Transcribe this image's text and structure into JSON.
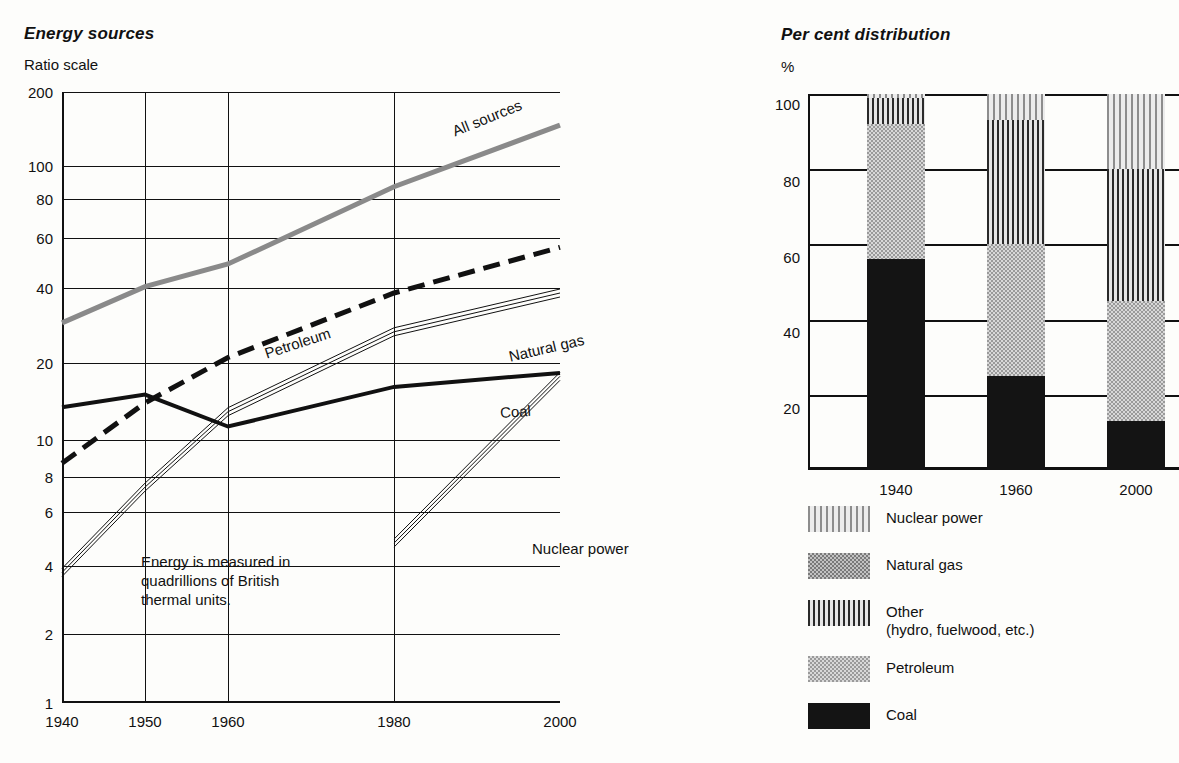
{
  "left": {
    "title": "Energy sources",
    "axis_unit": "Ratio scale",
    "note": "Energy is measured in\nquadrillions of British\nthermal units.",
    "note_lines": [
      "Energy is measured in",
      "quadrillions of British",
      "thermal units."
    ],
    "yticks": [
      "200",
      "100",
      "80",
      "60",
      "40",
      "20",
      "10",
      "8",
      "6",
      "4",
      "2",
      "1"
    ],
    "xticks": [
      "1940",
      "1950",
      "1960",
      "1980",
      "2000"
    ],
    "series_labels": {
      "all_sources": "All sources",
      "petroleum": "Petroleum",
      "natural_gas": "Natural gas",
      "coal": "Coal",
      "nuclear": "Nuclear power"
    }
  },
  "right": {
    "title": "Per cent distribution",
    "axis_unit": "%",
    "yticks": [
      "100",
      "80",
      "60",
      "40",
      "20"
    ],
    "xticks": [
      "1940",
      "1960",
      "2000"
    ],
    "legend": [
      {
        "label": "Nuclear power",
        "sub": "",
        "pattern": "nuclear"
      },
      {
        "label": "Natural gas",
        "sub": "",
        "pattern": "gas"
      },
      {
        "label": "Other",
        "sub": "(hydro, fuelwood, etc.)",
        "pattern": "other"
      },
      {
        "label": "Petroleum",
        "sub": "",
        "pattern": "petroleum"
      },
      {
        "label": "Coal",
        "sub": "",
        "pattern": "coal"
      }
    ]
  },
  "colors": {
    "ink": "#111111",
    "all_sources_line": "#8a8a8a",
    "coal_fill": "#141414",
    "petroleum_fill": "#d8d8d8",
    "gas_fill": "#c2c2c2",
    "other_fill": "#e6e6e6",
    "nuclear_fill": "#ececec"
  },
  "chart_data": [
    {
      "type": "line",
      "id": "energy-sources",
      "title": "Energy sources",
      "subtitle": "Ratio scale",
      "xlabel": "",
      "ylabel": "Ratio scale",
      "yscale": "log",
      "ylim": [
        1,
        200
      ],
      "xlim": [
        1940,
        2000
      ],
      "grid": true,
      "ytick_values": [
        200,
        100,
        80,
        60,
        40,
        20,
        10,
        8,
        6,
        4,
        2,
        1
      ],
      "xtick_values": [
        1940,
        1950,
        1960,
        1980,
        2000
      ],
      "annotation": "Energy is measured in quadrillions of British thermal units.",
      "legend_position": "inline-labels",
      "series": [
        {
          "name": "All sources",
          "style": "thick-gray-solid",
          "x": [
            1940,
            1950,
            1960,
            1980,
            2000
          ],
          "values": [
            27,
            37,
            45,
            88,
            150
          ]
        },
        {
          "name": "Petroleum",
          "style": "thick-black-dashed",
          "x": [
            1940,
            1950,
            1960,
            1980,
            2000
          ],
          "values": [
            8,
            13.5,
            20,
            35,
            52
          ]
        },
        {
          "name": "Natural gas",
          "style": "triple-thin-line",
          "x": [
            1940,
            1950,
            1960,
            1980,
            2000
          ],
          "values": [
            3.1,
            6.5,
            12.5,
            25,
            35
          ]
        },
        {
          "name": "Coal",
          "style": "thick-black-solid",
          "x": [
            1940,
            1950,
            1960,
            1980,
            2000
          ],
          "values": [
            13,
            14.5,
            11,
            15.5,
            17.5
          ]
        },
        {
          "name": "Nuclear power",
          "style": "triple-thin-line",
          "x": [
            1980,
            2000
          ],
          "values": [
            4,
            17
          ]
        }
      ]
    },
    {
      "type": "bar",
      "id": "per-cent-distribution",
      "title": "Per cent distribution",
      "xlabel": "",
      "ylabel": "%",
      "stacked": true,
      "ylim": [
        0,
        100
      ],
      "grid": true,
      "ytick_values": [
        100,
        80,
        60,
        40,
        20
      ],
      "categories": [
        "1940",
        "1960",
        "2000"
      ],
      "legend_position": "below",
      "series": [
        {
          "name": "Coal",
          "pattern": "solid-black",
          "values": [
            56,
            25,
            13
          ]
        },
        {
          "name": "Petroleum",
          "pattern": "light-stipple",
          "values": [
            36,
            35,
            32
          ]
        },
        {
          "name": "Other (hydro, fuelwood, etc.)",
          "pattern": "dark-vertical-stripes",
          "values": [
            7,
            33,
            35
          ]
        },
        {
          "name": "Natural gas",
          "pattern": "medium-stipple",
          "values": [
            0,
            0,
            0
          ]
        },
        {
          "name": "Nuclear power",
          "pattern": "light-vertical-stripes",
          "values": [
            1,
            7,
            20
          ]
        }
      ]
    }
  ]
}
